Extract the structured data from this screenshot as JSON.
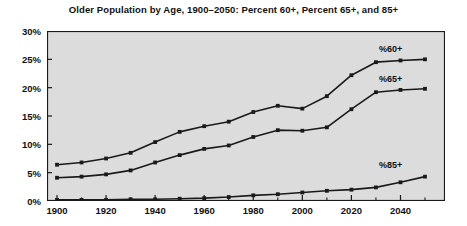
{
  "chart_data": {
    "type": "line",
    "title": "Older Population by Age, 1900–2050: Percent 60+, Percent 65+, and 85+",
    "xlabel": "",
    "ylabel": "",
    "xlim": [
      1900,
      2050
    ],
    "ylim": [
      0,
      30
    ],
    "y_tick_labels": [
      "0%",
      "5%",
      "10%",
      "15%",
      "20%",
      "25%",
      "30%"
    ],
    "y_ticks": [
      0,
      5,
      10,
      15,
      20,
      25,
      30
    ],
    "x_tick_labels": [
      "1900",
      "1920",
      "1940",
      "1960",
      "1980",
      "2000",
      "2020",
      "2040"
    ],
    "x_ticks": [
      1900,
      1920,
      1940,
      1960,
      1980,
      2000,
      2020,
      2040
    ],
    "x_minor_ticks": [
      1910,
      1930,
      1950,
      1970,
      1990,
      2010,
      2030,
      2050
    ],
    "grid": false,
    "legend_position": "inline-right",
    "x": [
      1900,
      1910,
      1920,
      1930,
      1940,
      1950,
      1960,
      1970,
      1980,
      1990,
      2000,
      2010,
      2020,
      2030,
      2040,
      2050
    ],
    "series": [
      {
        "name": "%60+",
        "label": "%60+",
        "color": "#1a1a1a",
        "values": [
          6.4,
          6.8,
          7.5,
          8.5,
          10.4,
          12.2,
          13.2,
          14.0,
          15.7,
          16.8,
          16.3,
          18.5,
          22.2,
          24.5,
          24.8,
          25.0
        ]
      },
      {
        "name": "%65+",
        "label": "%65+",
        "color": "#1a1a1a",
        "values": [
          4.1,
          4.3,
          4.7,
          5.4,
          6.8,
          8.1,
          9.2,
          9.8,
          11.3,
          12.5,
          12.4,
          13.0,
          16.2,
          19.2,
          19.6,
          19.8
        ]
      },
      {
        "name": "%85+",
        "label": "%85+",
        "color": "#1a1a1a",
        "values": [
          0.2,
          0.2,
          0.2,
          0.3,
          0.3,
          0.4,
          0.5,
          0.7,
          1.0,
          1.2,
          1.5,
          1.8,
          2.0,
          2.4,
          3.3,
          4.3
        ]
      }
    ],
    "annotations": [
      {
        "text": "%60+",
        "x": 2036,
        "y": 26.6
      },
      {
        "text": "%65+",
        "x": 2036,
        "y": 21.4
      },
      {
        "text": "%85+",
        "x": 2036,
        "y": 6.2
      }
    ],
    "colors": {
      "plot_background": "#dcdcdc",
      "figure_background": "#ffffff",
      "line": "#1a1a1a",
      "axis": "#1a1a1a",
      "text": "#111111"
    }
  }
}
